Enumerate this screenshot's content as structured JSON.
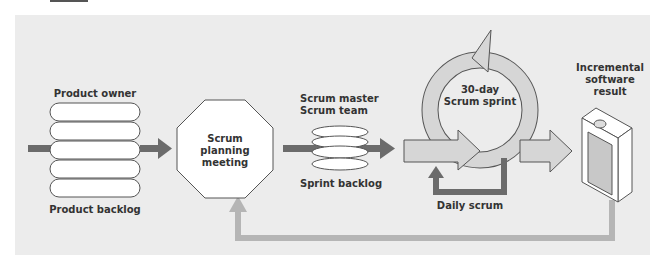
{
  "labels": {
    "product_owner": "Product owner",
    "product_backlog": "Product backlog",
    "planning_line1": "Scrum",
    "planning_line2": "planning",
    "planning_line3": "meeting",
    "scrum_master": "Scrum master",
    "scrum_team": "Scrum team",
    "sprint_backlog": "Sprint backlog",
    "sprint_line1": "30-day",
    "sprint_line2": "Scrum sprint",
    "daily_scrum": "Daily scrum",
    "result_line1": "Incremental",
    "result_line2": "software",
    "result_line3": "result"
  },
  "colors": {
    "panel_bg": "#ececec",
    "dark_arrow": "#6b6b6b",
    "light_arrow": "#b5b5b5",
    "shape_fill": "#ffffff",
    "sprint_fill": "#d6d6d6",
    "stroke": "#555555"
  }
}
